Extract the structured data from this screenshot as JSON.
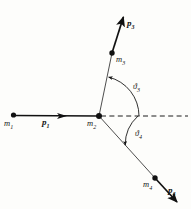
{
  "figure": {
    "background_color": "#fdfdfb",
    "line_color": "#1a1a1a",
    "width": 191,
    "height": 209
  },
  "labels": {
    "m1": "m",
    "m1_sub": "1",
    "p1": "p",
    "p1_sub": "1",
    "m2": "m",
    "m2_sub": "2",
    "m3": "m",
    "m3_sub": "3",
    "p3": "p",
    "p3_sub": "3",
    "m4": "m",
    "m4_sub": "4",
    "p4": "p",
    "p4_sub": "4",
    "theta3": "ϑ",
    "theta3_sub": "3",
    "theta4": "ϑ",
    "theta4_sub": "4"
  },
  "geometry": {
    "vertex": {
      "x": 99,
      "y": 116
    },
    "m1_point": {
      "x": 13,
      "y": 115
    },
    "m3_point": {
      "x": 112,
      "y": 53
    },
    "m4_point": {
      "x": 155,
      "y": 178
    },
    "p3_tip": {
      "x": 126,
      "y": 12
    },
    "p4_tip": {
      "x": 181,
      "y": 206
    },
    "p1_arrow_tip": {
      "x": 67,
      "y": 116
    },
    "dashed_axis_end": {
      "x": 188,
      "y": 116
    },
    "theta3_degrees": 78,
    "theta4_degrees": 48
  }
}
